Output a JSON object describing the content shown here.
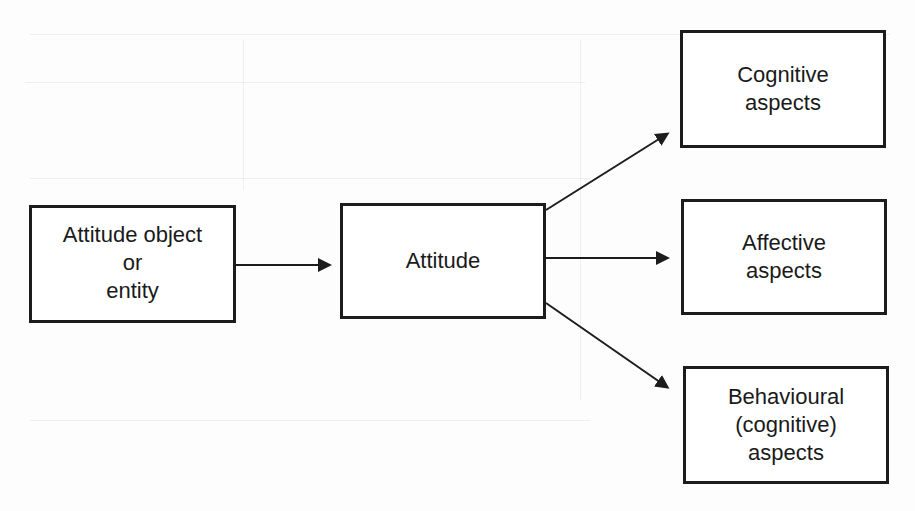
{
  "diagram": {
    "type": "flow",
    "nodes": [
      {
        "id": "object",
        "lines": [
          "Attitude object",
          "or",
          "entity"
        ]
      },
      {
        "id": "attitude",
        "lines": [
          "Attitude"
        ]
      },
      {
        "id": "cognitive",
        "lines": [
          "Cognitive",
          "aspects"
        ]
      },
      {
        "id": "affective",
        "lines": [
          "Affective",
          "aspects"
        ]
      },
      {
        "id": "behavioural",
        "lines": [
          "Behavioural",
          "(cognitive)",
          "aspects"
        ]
      }
    ],
    "edges": [
      {
        "from": "object",
        "to": "attitude"
      },
      {
        "from": "attitude",
        "to": "cognitive"
      },
      {
        "from": "attitude",
        "to": "affective"
      },
      {
        "from": "attitude",
        "to": "behavioural"
      }
    ],
    "colors": {
      "stroke": "#1c1c1c",
      "text": "#1a1a1a",
      "background": "#ffffff"
    }
  }
}
